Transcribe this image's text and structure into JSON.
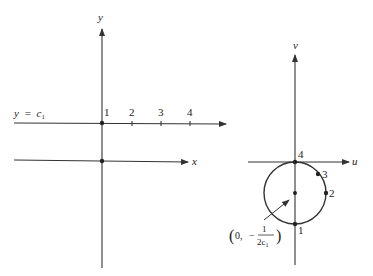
{
  "left_plot": {
    "y_axis_label": "y",
    "x_axis_label": "x",
    "line_label_var": "y",
    "line_label_eq": "=",
    "line_label_const": "c",
    "line_label_sub": "1",
    "tick_labels": [
      "1",
      "2",
      "3",
      "4"
    ]
  },
  "right_plot": {
    "v_axis_label": "v",
    "u_axis_label": "u",
    "point_labels": [
      "1",
      "2",
      "3",
      "4"
    ],
    "center_label": {
      "open": "(0,",
      "minus": "−",
      "numerator": "1",
      "denominator": "2c",
      "denominator_sub": "1",
      "close": ")"
    }
  },
  "colors": {
    "ink": "#333333",
    "background": "#ffffff"
  }
}
